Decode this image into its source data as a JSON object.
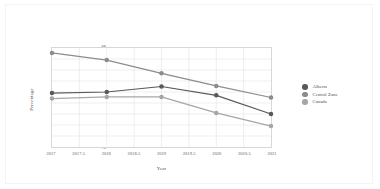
{
  "chart_data": {
    "type": "line",
    "title": "",
    "xlabel": "Year",
    "ylabel": "Percentage",
    "xlim": [
      2017,
      2021
    ],
    "ylim": [
      70,
      88
    ],
    "grid": true,
    "legend_position": "right",
    "x": [
      2017,
      2018,
      2019,
      2020,
      2021
    ],
    "xticks": [
      "2017",
      "2017.5",
      "2018",
      "2018.5",
      "2019",
      "2019.5",
      "2020",
      "2020.5",
      "2021"
    ],
    "xtick_values": [
      2017,
      2017.5,
      2018,
      2018.5,
      2019,
      2019.5,
      2020,
      2020.5,
      2021
    ],
    "yticks": [
      "88",
      "86",
      "84",
      "82",
      "80",
      "78",
      "76",
      "74",
      "72",
      "70"
    ],
    "ytick_values": [
      88,
      86,
      84,
      82,
      80,
      78,
      76,
      74,
      72,
      70
    ],
    "series": [
      {
        "name": "Alberta",
        "color": "#595959",
        "values": [
          79.8,
          80.0,
          81.0,
          79.4,
          76.0
        ]
      },
      {
        "name": "Central Zone",
        "color": "#8c8c8c",
        "values": [
          87.1,
          85.8,
          83.4,
          81.1,
          79.0
        ]
      },
      {
        "name": "Canada",
        "color": "#a6a6a6",
        "values": [
          78.8,
          79.1,
          79.1,
          76.2,
          73.8
        ]
      }
    ]
  },
  "legend": {
    "items": [
      {
        "label": "Alberta",
        "color": "#595959"
      },
      {
        "label": "Central Zone",
        "color": "#8c8c8c"
      },
      {
        "label": "Canada",
        "color": "#a6a6a6"
      }
    ]
  },
  "axes": {
    "y_title": "Percentage",
    "x_title": "Year"
  },
  "style": {
    "grid_color": "#dcdcdc",
    "frame_color": "#d8d8d8",
    "tick_text_color": "#5a5a5a",
    "background": "#ffffff"
  }
}
